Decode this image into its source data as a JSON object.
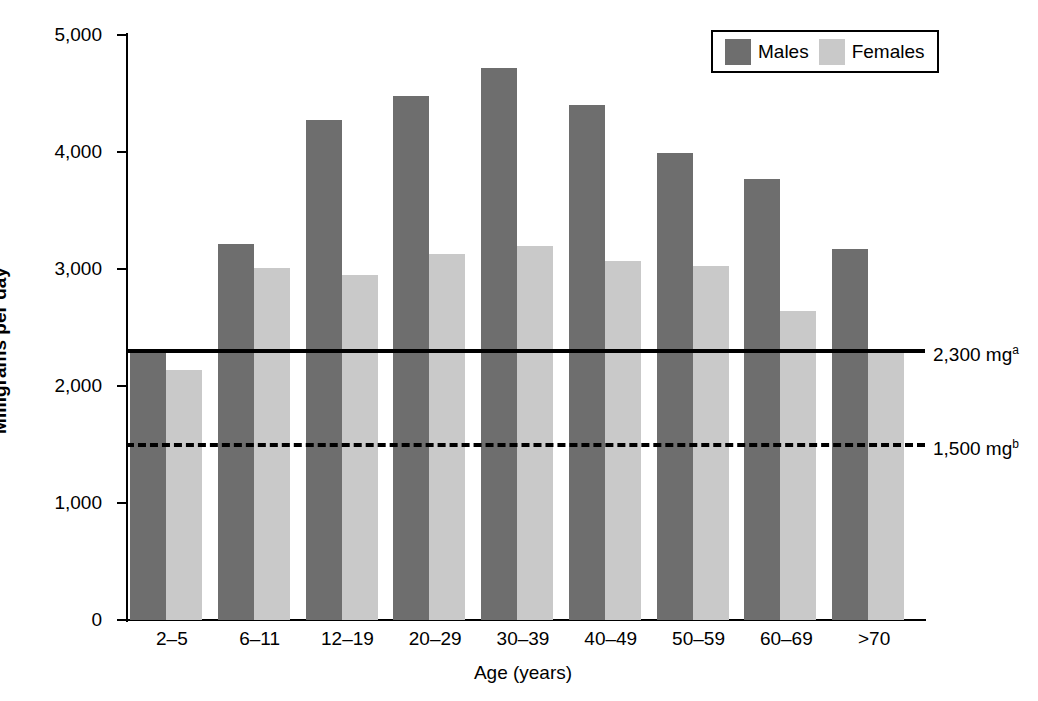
{
  "chart_data": {
    "type": "bar",
    "title": "",
    "xlabel": "Age (years)",
    "ylabel": "Milligrams per day",
    "categories": [
      "2–5",
      "6–11",
      "12–19",
      "20–29",
      "30–39",
      "40–49",
      "50–59",
      "60–69",
      ">70"
    ],
    "series": [
      {
        "name": "Males",
        "color": "#6e6e6e",
        "values": [
          2290,
          3210,
          4270,
          4480,
          4720,
          4400,
          3990,
          3770,
          3170
        ]
      },
      {
        "name": "Females",
        "color": "#c9c9c9",
        "values": [
          2140,
          3010,
          2950,
          3130,
          3200,
          3070,
          3030,
          2640,
          2300
        ]
      }
    ],
    "ylim": [
      0,
      5000
    ],
    "yticks": [
      0,
      1000,
      2000,
      3000,
      4000,
      5000
    ],
    "ytick_labels": [
      "0",
      "1,000",
      "2,000",
      "3,000",
      "4,000",
      "5,000"
    ],
    "grid": false,
    "legend_position": "top-right",
    "reference_lines": [
      {
        "value": 2300,
        "style": "solid",
        "label": "2,300 mg",
        "superscript": "a",
        "color": "#000000"
      },
      {
        "value": 1500,
        "style": "dashed",
        "label": "1,500 mg",
        "superscript": "b",
        "color": "#000000"
      }
    ]
  },
  "legend": {
    "entries": [
      {
        "label": "Males"
      },
      {
        "label": "Females"
      }
    ]
  }
}
